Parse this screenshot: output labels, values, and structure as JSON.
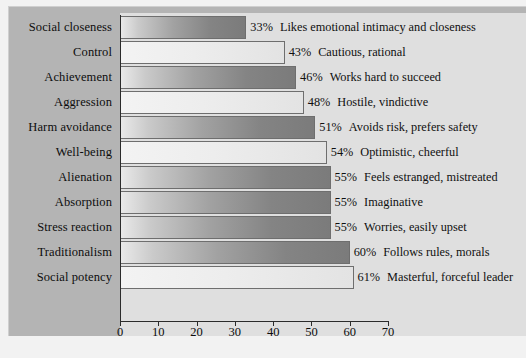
{
  "chart_data": {
    "type": "bar",
    "orientation": "horizontal",
    "title": "",
    "subtitle": "",
    "xlabel": "",
    "ylabel": "",
    "xlim": [
      0,
      70
    ],
    "xticks": [
      0,
      10,
      20,
      30,
      40,
      50,
      60,
      70
    ],
    "xtick_labels": [
      "0",
      "10",
      "20",
      "30",
      "40",
      "50",
      "60",
      "70"
    ],
    "grid": false,
    "legend": "none",
    "value_suffix": "%",
    "categories": [
      "Social closeness",
      "Control",
      "Achievement",
      "Aggression",
      "Harm avoidance",
      "Well-being",
      "Alienation",
      "Absorption",
      "Stress reaction",
      "Traditionalism",
      "Social potency"
    ],
    "values": [
      33,
      43,
      46,
      48,
      51,
      54,
      55,
      55,
      55,
      60,
      61
    ],
    "value_labels": [
      "33%",
      "43%",
      "46%",
      "48%",
      "51%",
      "54%",
      "55%",
      "55%",
      "55%",
      "60%",
      "61%"
    ],
    "annotations": [
      "Likes emotional intimacy and closeness",
      "Cautious, rational",
      "Works hard to succeed",
      "Hostile, vindictive",
      "Avoids risk, prefers safety",
      "Optimistic, cheerful",
      "Feels estranged, mistreated",
      "Imaginative",
      "Worries, easily upset",
      "Follows rules, morals",
      "Masterful, forceful leader"
    ],
    "bar_styles": [
      "dark",
      "light",
      "dark",
      "light",
      "dark",
      "light",
      "dark",
      "dark",
      "dark",
      "dark",
      "light"
    ],
    "colors": {
      "panel_background": "#b4b4b4",
      "plot_background": "#dfdfdf",
      "page_background": "#f2f2f2",
      "bar_dark_start": "#e9e9e9",
      "bar_dark_end": "#7b7b7b",
      "bar_light_start": "#f3f3f3",
      "bar_light_end": "#e3e3e3",
      "bar_border": "#6e6e6e",
      "axis": "#2b2b2b",
      "text": "#0d0d0d"
    }
  }
}
